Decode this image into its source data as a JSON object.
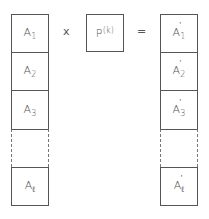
{
  "diagram": {
    "left_column": {
      "cells": [
        {
          "base": "A",
          "sub": "1"
        },
        {
          "base": "A",
          "sub": "2"
        },
        {
          "base": "A",
          "sub": "3"
        },
        {
          "base": "",
          "sub": "",
          "dashed": true
        },
        {
          "base": "A",
          "sub": "ℓ"
        }
      ]
    },
    "operator_multiply": "x",
    "matrix": {
      "base": "P",
      "sup": "(k)"
    },
    "operator_equals": "=",
    "right_column": {
      "cells": [
        {
          "base": "A",
          "prime": "′",
          "sub": "1"
        },
        {
          "base": "A",
          "prime": "′",
          "sub": "2"
        },
        {
          "base": "A",
          "prime": "′",
          "sub": "3"
        },
        {
          "base": "",
          "prime": "",
          "sub": "",
          "dashed": true
        },
        {
          "base": "A",
          "prime": "′",
          "sub": "ℓ"
        }
      ]
    }
  }
}
